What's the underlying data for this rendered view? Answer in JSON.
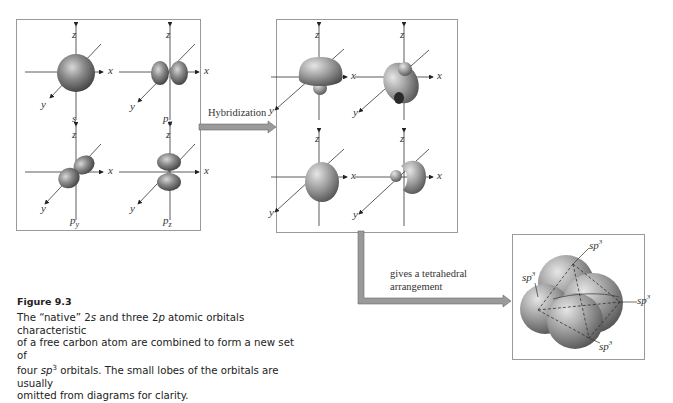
{
  "figure": {
    "title": "Figure 9.3",
    "caption": {
      "line1_pre": "The “native” 2",
      "line1_s": "s",
      "line1_mid": " and three 2",
      "line1_p": "p",
      "line1_post": " atomic orbitals characteristic",
      "line2": "of a free carbon atom are combined to form a new set of",
      "line3_pre": "four ",
      "line3_sp": "sp",
      "line3_sup": "3",
      "line3_post": " orbitals. The small lobes of the orbitals are usually",
      "line4": "omitted from diagrams for clarity."
    }
  },
  "panels": {
    "atomic": {
      "orbitals": [
        {
          "name": "s",
          "sub": ""
        },
        {
          "name": "p",
          "sub": "x"
        },
        {
          "name": "p",
          "sub": "y"
        },
        {
          "name": "p",
          "sub": "z"
        }
      ]
    },
    "hybrid": {
      "count": 4
    },
    "tetrahedral": {
      "labels": [
        {
          "base": "sp",
          "sup": "3"
        },
        {
          "base": "sp",
          "sup": "3"
        },
        {
          "base": "sp",
          "sup": "3"
        },
        {
          "base": "sp",
          "sup": "3"
        }
      ]
    }
  },
  "axes": {
    "x": "x",
    "y": "y",
    "z": "z"
  },
  "arrows": {
    "hybridization": "Hybridization",
    "tetrahedral_line1": "gives a tetrahedral",
    "tetrahedral_line2": "arrangement"
  },
  "colors": {
    "orbital": "#6f6f6f",
    "orbital_highlight": "#cfcfcf",
    "arrow_fill": "#9a9a9a",
    "frame": "#9a9a9a"
  }
}
